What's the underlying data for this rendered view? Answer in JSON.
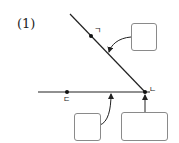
{
  "problem": {
    "number_label": "(1)"
  },
  "points": [
    {
      "id": "giyeok",
      "label": "ㄱ",
      "on": "diagonal-line"
    },
    {
      "id": "digeut",
      "label": "ㄷ",
      "on": "horizontal-line"
    },
    {
      "id": "nieun",
      "label": "ㄴ",
      "on": "intersection"
    }
  ],
  "answer_boxes": [
    {
      "id": "box-diagonal",
      "value": "",
      "points_to": "diagonal-line"
    },
    {
      "id": "box-horizontal",
      "value": "",
      "points_to": "horizontal-line"
    },
    {
      "id": "box-point",
      "value": "",
      "points_to": "point-nieun"
    }
  ],
  "colors": {
    "line": "#222222",
    "box_border": "#8a8a8a",
    "background": "#ffffff"
  }
}
